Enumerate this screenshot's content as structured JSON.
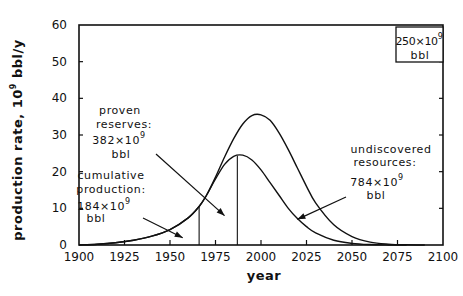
{
  "chart_data": {
    "type": "line",
    "title": "",
    "xlabel": "year",
    "ylabel": "production rate, 10^9 bbl/y",
    "ylabel_parts": {
      "prefix": "production rate, 10",
      "sup": "9",
      "suffix": " bbl/y"
    },
    "xlim": [
      1900,
      2100
    ],
    "ylim": [
      0,
      60
    ],
    "x_ticks": [
      1900,
      1925,
      1950,
      1975,
      2000,
      2025,
      2050,
      2075,
      2100
    ],
    "x_tick_labels": [
      "1900",
      "1925",
      "1950",
      "1975",
      "2000",
      "2025",
      "2050",
      "2075",
      "2100"
    ],
    "y_ticks": [
      0,
      10,
      20,
      30,
      40,
      50,
      60
    ],
    "y_tick_labels": [
      "0",
      "10",
      "20",
      "30",
      "40",
      "50",
      "60"
    ],
    "grid": false,
    "series": [
      {
        "name": "ultimate-resources-curve",
        "x": [
          1900,
          1910,
          1920,
          1930,
          1940,
          1950,
          1960,
          1966,
          1970,
          1975,
          1980,
          1985,
          1990,
          1995,
          2000,
          2005,
          2010,
          2015,
          2020,
          2025,
          2030,
          2040,
          2050,
          2060,
          2070,
          2080,
          2090
        ],
        "values": [
          0,
          0.2,
          0.6,
          1.3,
          2.4,
          4.2,
          7.4,
          10.5,
          13.5,
          18.5,
          24.0,
          29.0,
          33.0,
          35.3,
          35.5,
          34.0,
          30.5,
          26.0,
          21.0,
          16.0,
          11.5,
          5.5,
          2.3,
          0.8,
          0.25,
          0.05,
          0
        ]
      },
      {
        "name": "proven-curve",
        "x": [
          1900,
          1910,
          1920,
          1930,
          1940,
          1950,
          1960,
          1966,
          1970,
          1975,
          1980,
          1985,
          1990,
          1995,
          2000,
          2005,
          2010,
          2015,
          2020,
          2025,
          2030,
          2040,
          2050,
          2060,
          2070,
          2080
        ],
        "values": [
          0,
          0.2,
          0.6,
          1.3,
          2.4,
          4.2,
          7.4,
          10.5,
          13.5,
          18.0,
          22.0,
          24.2,
          24.5,
          23.2,
          20.5,
          17.0,
          13.5,
          10.0,
          7.2,
          5.0,
          3.3,
          1.3,
          0.45,
          0.12,
          0.02,
          0
        ]
      }
    ],
    "vertical_markers": [
      {
        "x": 1966,
        "note": "end of cumulative production"
      },
      {
        "x": 1987,
        "note": "end of proven reserves"
      }
    ],
    "annotations": [
      {
        "id": "proven",
        "lines": [
          "proven",
          "reserves:",
          "382×10^9",
          "bbl"
        ],
        "value": "382×10^9 bbl",
        "arrow_to": [
          1980,
          8
        ]
      },
      {
        "id": "cumulative",
        "lines": [
          "cumulative",
          "production:",
          "184×10^9",
          "bbl"
        ],
        "value": "184×10^9 bbl",
        "arrow_to": [
          1957,
          2
        ]
      },
      {
        "id": "undiscovered",
        "lines": [
          "undiscovered",
          "resources:",
          "784×10^9",
          "bbl"
        ],
        "value": "784×10^9 bbl",
        "arrow_to": [
          2020,
          7
        ]
      },
      {
        "id": "boxed",
        "lines": [
          "250×10^9",
          "bbl"
        ],
        "value": "250×10^9 bbl",
        "position": "top-right"
      }
    ],
    "legend": "none"
  },
  "labels": {
    "proven": {
      "l1": "proven",
      "l2": "reserves:",
      "num": "382×10",
      "exp": "9",
      "unit": "bbl"
    },
    "cumulative": {
      "l1": "cumulative",
      "l2": "production:",
      "num": "184×10",
      "exp": "9",
      "unit": "bbl"
    },
    "undiscovered": {
      "l1": "undiscovered",
      "l2": "resources:",
      "num": "784×10",
      "exp": "9",
      "unit": "bbl"
    },
    "boxed": {
      "num": "250×10",
      "exp": "9",
      "unit": "bbl"
    }
  }
}
